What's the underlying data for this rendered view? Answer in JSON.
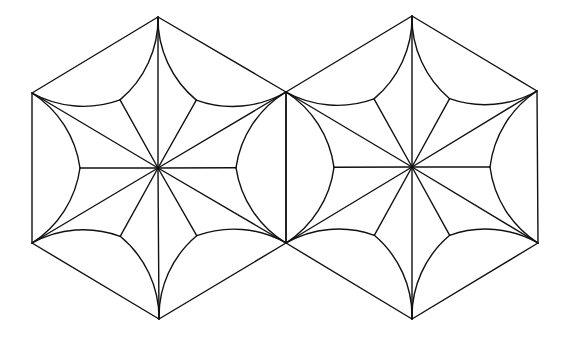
{
  "diagram": {
    "type": "geometric-pattern",
    "canvas": {
      "width": 579,
      "height": 339,
      "background": "#ffffff"
    },
    "stroke_color": "#111111",
    "stroke_width": 1.4,
    "hexagons": [
      {
        "id": "left-hexagon",
        "center": [
          158,
          168
        ],
        "vertices": [
          [
            158,
            17
          ],
          [
            286,
            92
          ],
          [
            286,
            243
          ],
          [
            159,
            319
          ],
          [
            32,
            243
          ],
          [
            32,
            93
          ]
        ],
        "cusp_radius": 78,
        "arc_radius": 106
      },
      {
        "id": "right-hexagon",
        "center": [
          412,
          167
        ],
        "vertices": [
          [
            412,
            16
          ],
          [
            537,
            91
          ],
          [
            538,
            243
          ],
          [
            412,
            319
          ],
          [
            286,
            243
          ],
          [
            286,
            92
          ]
        ],
        "cusp_radius": 78,
        "arc_radius": 106
      }
    ],
    "petal_count_per_hexagon": 6
  }
}
